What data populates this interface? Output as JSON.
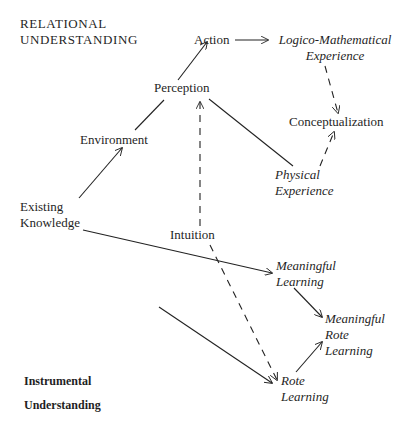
{
  "diagram": {
    "headings": {
      "relational_line1": "RELATIONAL",
      "relational_line2": "UNDERSTANDING",
      "instrumental_line1": "Instrumental",
      "instrumental_line2": "Understanding"
    },
    "nodes": {
      "action": "Action",
      "logico_line1": "Logico-Mathematical",
      "logico_line2": "Experience",
      "perception": "Perception",
      "conceptualization": "Conceptualization",
      "environment": "Environment",
      "physical_line1": "Physical",
      "physical_line2": "Experience",
      "existing_line1": "Existing",
      "existing_line2": "Knowledge",
      "intuition": "Intuition",
      "meaningful_learning_line1": "Meaningful",
      "meaningful_learning_line2": "Learning",
      "meaningful_rote_line1": "Meaningful",
      "meaningful_rote_line2": "Rote",
      "meaningful_rote_line3": "Learning",
      "rote_line1": "Rote",
      "rote_line2": "Learning"
    },
    "edges": [
      {
        "from": "Existing Knowledge",
        "to": "Environment",
        "style": "solid",
        "arrow": true
      },
      {
        "from": "Environment",
        "to": "Perception",
        "style": "solid",
        "arrow": false
      },
      {
        "from": "Perception",
        "to": "Action",
        "style": "solid",
        "arrow": true
      },
      {
        "from": "Action",
        "to": "Logico-Mathematical Experience",
        "style": "solid",
        "arrow": true
      },
      {
        "from": "Logico-Mathematical Experience",
        "to": "Conceptualization",
        "style": "dashed",
        "arrow": true
      },
      {
        "from": "Perception",
        "to": "Physical Experience",
        "style": "solid",
        "arrow": false
      },
      {
        "from": "Physical Experience",
        "to": "Conceptualization",
        "style": "dashed",
        "arrow": true
      },
      {
        "from": "Intuition",
        "to": "Perception",
        "style": "dashed",
        "arrow": true
      },
      {
        "from": "Existing Knowledge",
        "to": "Meaningful Learning",
        "style": "solid",
        "arrow": true
      },
      {
        "from": "Meaningful Learning",
        "to": "Meaningful Rote Learning",
        "style": "solid",
        "arrow": true
      },
      {
        "from": "Rote Learning",
        "to": "Meaningful Rote Learning",
        "style": "solid",
        "arrow": true
      },
      {
        "from": "Intuition",
        "to": "Rote Learning",
        "style": "dashed",
        "arrow": true
      },
      {
        "from": "Instrumental Understanding",
        "to": "Rote Learning",
        "style": "solid",
        "arrow": true
      }
    ]
  }
}
